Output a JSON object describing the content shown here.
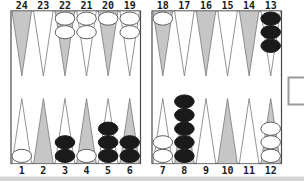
{
  "board": {
    "top_row": [
      {
        "point": 24,
        "checkers": 0,
        "checker_color": null
      },
      {
        "point": 23,
        "checkers": 0,
        "checker_color": null
      },
      {
        "point": 22,
        "checkers": 2,
        "checker_color": "white"
      },
      {
        "point": 21,
        "checkers": 2,
        "checker_color": "white"
      },
      {
        "point": 20,
        "checkers": 1,
        "checker_color": "white"
      },
      {
        "point": 19,
        "checkers": 2,
        "checker_color": "white"
      },
      {
        "point": 18,
        "checkers": 1,
        "checker_color": "white"
      },
      {
        "point": 17,
        "checkers": 0,
        "checker_color": null
      },
      {
        "point": 16,
        "checkers": 0,
        "checker_color": null
      },
      {
        "point": 15,
        "checkers": 0,
        "checker_color": null
      },
      {
        "point": 14,
        "checkers": 0,
        "checker_color": null
      },
      {
        "point": 13,
        "checkers": 3,
        "checker_color": "black"
      }
    ],
    "bottom_row": [
      {
        "point": 1,
        "checkers": 1,
        "checker_color": "white"
      },
      {
        "point": 2,
        "checkers": 0,
        "checker_color": null
      },
      {
        "point": 3,
        "checkers": 2,
        "checker_color": "black"
      },
      {
        "point": 4,
        "checkers": 1,
        "checker_color": "white"
      },
      {
        "point": 5,
        "checkers": 3,
        "checker_color": "black"
      },
      {
        "point": 6,
        "checkers": 2,
        "checker_color": "black"
      },
      {
        "point": 7,
        "checkers": 2,
        "checker_color": "white"
      },
      {
        "point": 8,
        "checkers": 5,
        "checker_color": "black"
      },
      {
        "point": 9,
        "checkers": 0,
        "checker_color": null
      },
      {
        "point": 10,
        "checkers": 0,
        "checker_color": null
      },
      {
        "point": 11,
        "checkers": 0,
        "checker_color": null
      },
      {
        "point": 12,
        "checkers": 3,
        "checker_color": "white"
      }
    ],
    "bar_checkers": 0,
    "side_box_empty": true,
    "colors": {
      "point_gray": "#c6c6c6",
      "point_white": "#ffffff",
      "point_outline": "#787878",
      "frame": "#4a4a4a",
      "checker_black": "#1a1a1a",
      "checker_white": "#ffffff",
      "checker_outline": "#5e5e5e",
      "label": "#1a1a1a",
      "edge_shadow": "#d4d4d4",
      "side_box_border": "#9a9a9a"
    }
  }
}
